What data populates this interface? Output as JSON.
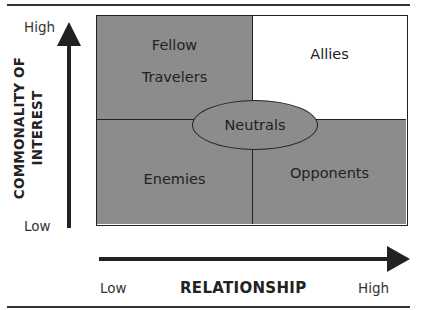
{
  "diagram": {
    "type": "2x2 matrix",
    "quadrants": {
      "top_left": {
        "label": "Fellow Travelers",
        "line1": "Fellow",
        "line2": "Travelers",
        "fill": "#8c8c8c"
      },
      "top_right": {
        "label": "Allies",
        "fill": "#ffffff"
      },
      "bottom_left": {
        "label": "Enemies",
        "fill": "#8c8c8c"
      },
      "bottom_right": {
        "label": "Opponents",
        "fill": "#8c8c8c"
      }
    },
    "center": {
      "label": "Neutrals",
      "shape": "ellipse",
      "fill": "#8c8c8c"
    },
    "y_axis": {
      "title_line1": "COMMONALITY OF",
      "title_line2": "INTEREST",
      "high": "High",
      "low": "Low"
    },
    "x_axis": {
      "title": "RELATIONSHIP",
      "low": "Low",
      "high": "High"
    }
  }
}
